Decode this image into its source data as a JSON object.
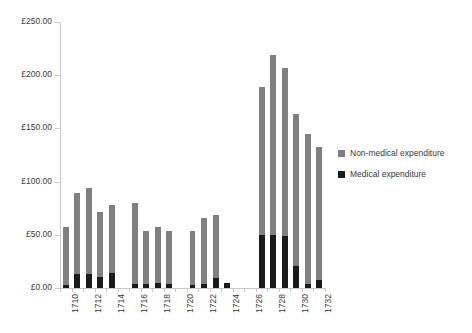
{
  "chart_data": {
    "type": "bar",
    "title": "",
    "subtitle": "",
    "xlabel": "",
    "ylabel": "",
    "stacked": true,
    "grid": false,
    "legend_position": "right",
    "ylim": [
      0,
      250
    ],
    "ytick_values": [
      0,
      50,
      100,
      150,
      200,
      250
    ],
    "ytick_labels": [
      "£0.00",
      "£50.00",
      "£100.00",
      "£150.00",
      "£200.00",
      "£250.00"
    ],
    "currency_symbol": "£",
    "xtick_label_interval": 2,
    "categories": [
      "1710",
      "1711",
      "1712",
      "1713",
      "1714",
      "1715",
      "1716",
      "1717",
      "1718",
      "1719",
      "1720",
      "1721",
      "1722",
      "1723",
      "1724",
      "1725",
      "1726",
      "1727",
      "1728",
      "1729",
      "1730",
      "1731",
      "1732"
    ],
    "xtick_labels_shown": [
      "1710",
      "1712",
      "1714",
      "1716",
      "1718",
      "1720",
      "1722",
      "1724",
      "1726",
      "1728",
      "1730",
      "1732"
    ],
    "series": [
      {
        "name": "Medical expenditure",
        "color": "#1a1a1a",
        "values": [
          3,
          13,
          13,
          10,
          14,
          0,
          4,
          4,
          5,
          4,
          0,
          3,
          4,
          9,
          5,
          0,
          0,
          50,
          50,
          49,
          21,
          4,
          8
        ]
      },
      {
        "name": "Non-medical expenditure",
        "color": "#808080",
        "values": [
          54,
          76,
          81,
          61,
          64,
          0,
          76,
          50,
          52,
          50,
          0,
          51,
          62,
          60,
          0,
          0,
          0,
          139,
          169,
          158,
          143,
          141,
          125
        ]
      }
    ],
    "totals": [
      57,
      89,
      94,
      71,
      78,
      0,
      80,
      54,
      57,
      54,
      0,
      54,
      66,
      69,
      5,
      0,
      0,
      189,
      219,
      207,
      164,
      145,
      133
    ],
    "annotations": []
  },
  "legend": {
    "items": [
      {
        "label": "Non-medical expenditure",
        "color": "#808080"
      },
      {
        "label": "Medical expenditure",
        "color": "#1a1a1a"
      }
    ]
  },
  "axis": {
    "line_color": "#c9c9c9",
    "tick_color": "#c9c9c9",
    "text_color": "#3a3a3a"
  }
}
